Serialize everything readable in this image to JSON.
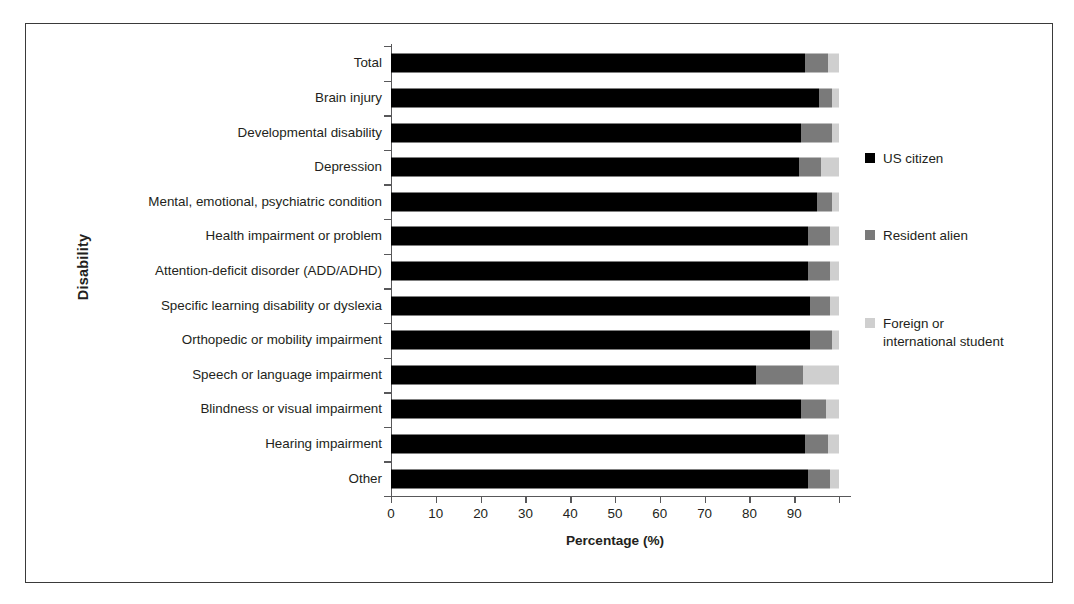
{
  "chart_data": {
    "type": "bar",
    "subtype": "horizontal stacked bar (100%)",
    "title": "",
    "xlabel": "Percentage (%)",
    "ylabel": "Disability",
    "xlim": [
      0,
      100
    ],
    "xticks": [
      0,
      10,
      20,
      30,
      40,
      50,
      60,
      70,
      80,
      90,
      100
    ],
    "xticklabels": [
      "0",
      "10",
      "20",
      "30",
      "40",
      "50",
      "60",
      "70",
      "80",
      "90",
      ""
    ],
    "grid": false,
    "legend_position": "right",
    "categories": [
      "Total",
      "Brain injury",
      "Developmental disability",
      "Depression",
      "Mental, emotional, psychiatric condition",
      "Health impairment or problem",
      "Attention-deficit disorder (ADD/ADHD)",
      "Specific learning disability or dyslexia",
      "Orthopedic or mobility impairment",
      "Speech or language impairment",
      "Blindness or visual impairment",
      "Hearing impairment",
      "Other"
    ],
    "series": [
      {
        "name": "US citizen",
        "color": "#000000",
        "values": [
          92.5,
          95.5,
          91.5,
          91.0,
          95.0,
          93.0,
          93.0,
          93.5,
          93.5,
          81.5,
          91.5,
          92.5,
          93.0
        ]
      },
      {
        "name": "Resident alien",
        "color": "#7a7a7a",
        "values": [
          5.0,
          3.0,
          7.0,
          5.0,
          3.5,
          5.0,
          5.0,
          4.5,
          5.0,
          10.5,
          5.5,
          5.0,
          5.0
        ]
      },
      {
        "name": "Foreign or international student",
        "color": "#cfcfcf",
        "values": [
          2.5,
          1.5,
          1.5,
          4.0,
          1.5,
          2.0,
          2.0,
          2.0,
          1.5,
          8.0,
          3.0,
          2.5,
          2.0
        ]
      }
    ]
  },
  "legend": {
    "items": [
      {
        "label": "US citizen",
        "color": "#000000"
      },
      {
        "label": "Resident alien",
        "color": "#7a7a7a"
      },
      {
        "label": "Foreign or international student",
        "color": "#cfcfcf"
      }
    ]
  }
}
